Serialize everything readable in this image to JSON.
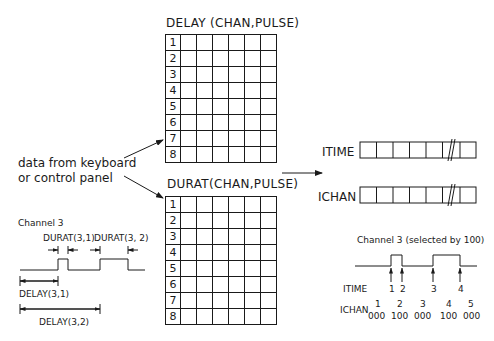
{
  "delay_table": {
    "title": "DELAY (CHAN,PULSE)",
    "rows": [
      "1",
      "2",
      "3",
      "4",
      "5",
      "6",
      "7",
      "8"
    ],
    "data_columns": 6
  },
  "durat_table": {
    "title": "DURAT(CHAN,PULSE)",
    "rows": [
      "1",
      "2",
      "3",
      "4",
      "5",
      "6",
      "7",
      "8"
    ],
    "data_columns": 6
  },
  "input_source": {
    "line1": "data from keyboard",
    "line2": "or control panel"
  },
  "left_timing": {
    "title": "Channel 3",
    "durat1": "DURAT(3,1)",
    "durat2": "DURAT(3, 2)",
    "delay1": "DELAY(3,1)",
    "delay2": "DELAY(3,2)"
  },
  "arrays": {
    "itime_label": "ITIME",
    "ichan_label": "ICHAN",
    "cells": 7,
    "break_cell": 6
  },
  "right_timing": {
    "title": "Channel 3 (selected by 100)",
    "itime_label": "ITIME",
    "ichan_label": "ICHAN",
    "itime_markers": [
      "1",
      "2",
      "3",
      "4"
    ],
    "ichan_index": [
      "1",
      "2",
      "3",
      "4",
      "5"
    ],
    "ichan_values": [
      "000",
      "100",
      "000",
      "100",
      "000"
    ]
  }
}
